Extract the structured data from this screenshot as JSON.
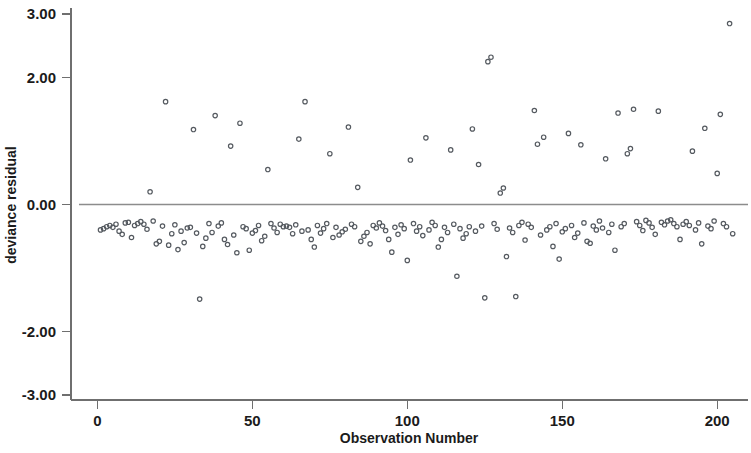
{
  "chart_data": {
    "type": "scatter",
    "title": "",
    "xlabel": "Observation Number",
    "ylabel": "deviance residual",
    "xlim": [
      -4,
      208
    ],
    "ylim": [
      -3.0,
      3.0
    ],
    "xticks": [
      0,
      50,
      100,
      150,
      200
    ],
    "xtick_labels": [
      "0",
      "50",
      "100",
      "150",
      "200"
    ],
    "yticks": [
      3.0,
      2.0,
      0.0,
      -2.0,
      -3.0
    ],
    "ytick_labels": [
      "3.00",
      "2.00",
      "0.00",
      "-2.00",
      "-3.00"
    ],
    "grid": false,
    "legend": null,
    "marker": "open-circle",
    "marker_color": "#555a60",
    "reference_lines": [
      {
        "axis": "y",
        "value": 0.0,
        "color": "#8c8c8c"
      }
    ],
    "n_points": 205,
    "series": [
      {
        "name": "deviance residual",
        "x": [
          1,
          2,
          3,
          4,
          5,
          6,
          7,
          8,
          9,
          10,
          11,
          12,
          13,
          14,
          15,
          16,
          17,
          18,
          19,
          20,
          21,
          22,
          23,
          24,
          25,
          26,
          27,
          28,
          29,
          30,
          31,
          32,
          33,
          34,
          35,
          36,
          37,
          38,
          39,
          40,
          41,
          42,
          43,
          44,
          45,
          46,
          47,
          48,
          49,
          50,
          51,
          52,
          53,
          54,
          55,
          56,
          57,
          58,
          59,
          60,
          61,
          62,
          63,
          64,
          65,
          66,
          67,
          68,
          69,
          70,
          71,
          72,
          73,
          74,
          75,
          76,
          77,
          78,
          79,
          80,
          81,
          82,
          83,
          84,
          85,
          86,
          87,
          88,
          89,
          90,
          91,
          92,
          93,
          94,
          95,
          96,
          97,
          98,
          99,
          100,
          101,
          102,
          103,
          104,
          105,
          106,
          107,
          108,
          109,
          110,
          111,
          112,
          113,
          114,
          115,
          116,
          117,
          118,
          119,
          120,
          121,
          122,
          123,
          124,
          125,
          126,
          127,
          128,
          129,
          130,
          131,
          132,
          133,
          134,
          135,
          136,
          137,
          138,
          139,
          140,
          141,
          142,
          143,
          144,
          145,
          146,
          147,
          148,
          149,
          150,
          151,
          152,
          153,
          154,
          155,
          156,
          157,
          158,
          159,
          160,
          161,
          162,
          163,
          164,
          165,
          166,
          167,
          168,
          169,
          170,
          171,
          172,
          173,
          174,
          175,
          176,
          177,
          178,
          179,
          180,
          181,
          182,
          183,
          184,
          185,
          186,
          187,
          188,
          189,
          190,
          191,
          192,
          193,
          194,
          195,
          196,
          197,
          198,
          199,
          200,
          201,
          202,
          203,
          204,
          205
        ],
        "y": [
          -0.4,
          -0.38,
          -0.35,
          -0.33,
          -0.36,
          -0.31,
          -0.42,
          -0.47,
          -0.29,
          -0.28,
          -0.52,
          -0.33,
          -0.3,
          -0.27,
          -0.31,
          -0.39,
          0.2,
          -0.26,
          -0.62,
          -0.58,
          -0.34,
          1.62,
          -0.64,
          -0.46,
          -0.32,
          -0.71,
          -0.42,
          -0.6,
          -0.37,
          -0.36,
          1.18,
          -0.45,
          -1.49,
          -0.66,
          -0.53,
          -0.3,
          -0.44,
          1.4,
          -0.34,
          -0.29,
          -0.55,
          -0.63,
          0.92,
          -0.48,
          -0.76,
          1.28,
          -0.35,
          -0.38,
          -0.72,
          -0.45,
          -0.41,
          -0.33,
          -0.57,
          -0.5,
          0.55,
          -0.3,
          -0.37,
          -0.44,
          -0.31,
          -0.35,
          -0.34,
          -0.36,
          -0.46,
          -0.32,
          1.03,
          -0.42,
          1.62,
          -0.4,
          -0.55,
          -0.67,
          -0.33,
          -0.45,
          -0.38,
          -0.3,
          0.8,
          -0.52,
          -0.36,
          -0.48,
          -0.43,
          -0.39,
          1.22,
          -0.31,
          -0.35,
          0.27,
          -0.58,
          -0.5,
          -0.44,
          -0.62,
          -0.33,
          -0.37,
          -0.29,
          -0.34,
          -0.41,
          -0.55,
          -0.75,
          -0.36,
          -0.47,
          -0.32,
          -0.38,
          -0.88,
          0.7,
          -0.3,
          -0.42,
          -0.35,
          -0.49,
          1.05,
          -0.4,
          -0.28,
          -0.33,
          -0.67,
          -0.55,
          -0.36,
          -0.44,
          0.86,
          -0.31,
          -1.13,
          -0.38,
          -0.53,
          -0.46,
          -0.35,
          1.19,
          -0.42,
          0.63,
          -0.34,
          -1.47,
          2.25,
          2.32,
          -0.3,
          -0.39,
          0.18,
          0.26,
          -0.82,
          -0.37,
          -0.44,
          -1.45,
          -0.33,
          -0.28,
          -0.56,
          -0.31,
          -0.36,
          1.48,
          0.95,
          -0.48,
          1.06,
          -0.4,
          -0.35,
          -0.66,
          -0.3,
          -0.86,
          -0.43,
          -0.38,
          1.12,
          -0.33,
          -0.52,
          -0.45,
          0.94,
          -0.29,
          -0.58,
          -0.61,
          -0.34,
          -0.4,
          -0.26,
          -0.37,
          0.72,
          -0.44,
          -0.31,
          -0.72,
          1.44,
          -0.35,
          -0.3,
          0.8,
          0.88,
          1.5,
          -0.27,
          -0.33,
          -0.41,
          -0.25,
          -0.29,
          -0.36,
          -0.47,
          1.47,
          -0.28,
          -0.32,
          -0.26,
          -0.24,
          -0.3,
          -0.35,
          -0.55,
          -0.31,
          -0.27,
          -0.33,
          0.84,
          -0.4,
          -0.29,
          -0.62,
          1.2,
          -0.34,
          -0.38,
          -0.26,
          0.49,
          1.42,
          -0.3,
          -0.35,
          2.85,
          -0.46
        ]
      }
    ]
  }
}
